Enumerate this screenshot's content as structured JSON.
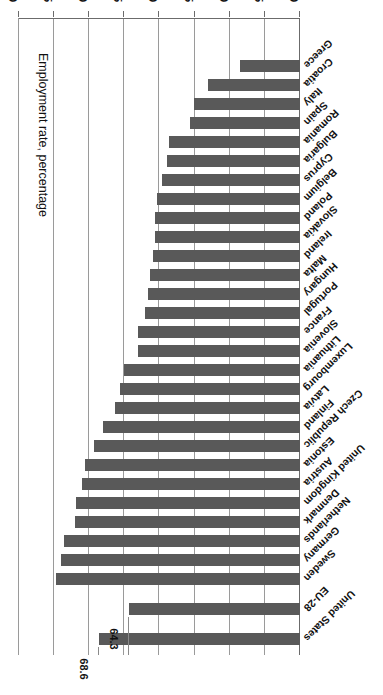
{
  "chart_data": {
    "type": "bar",
    "orientation": "horizontal",
    "title": "",
    "xlabel": "Employment rate, percentage",
    "ylabel": "",
    "xlim": [
      40,
      80
    ],
    "xticks": [
      80,
      75,
      70,
      65,
      60,
      55,
      50,
      45,
      40
    ],
    "grid": true,
    "legend": "none",
    "bar_color": "#595959",
    "categories": [
      "United States",
      "EU-28",
      "Sweden",
      "Germany",
      "Netherlands",
      "Denmark",
      "United Kingdom",
      "Austria",
      "Estonia",
      "Czech Republic",
      "Finland",
      "Latvia",
      "Luxembourg",
      "Lithuania",
      "Slovenia",
      "France",
      "Portugal",
      "Hungary",
      "Malta",
      "Ireland",
      "Slovakia",
      "Poland",
      "Belgium",
      "Cyprus",
      "Bulgaria",
      "Romania",
      "Spain",
      "Italy",
      "Croatia",
      "Greece"
    ],
    "values": [
      68.6,
      64.3,
      74.7,
      74.0,
      73.6,
      72.0,
      71.9,
      71.1,
      70.6,
      69.3,
      68.1,
      66.3,
      65.6,
      65.0,
      63.1,
      63.0,
      62.0,
      61.7,
      61.3,
      60.9,
      60.7,
      60.6,
      60.4,
      59.6,
      58.9,
      58.6,
      55.7,
      55.1,
      53.1,
      48.6
    ],
    "data_labels": {
      "United States": "68.6",
      "EU-28": "64.3"
    },
    "gap_after_index": [
      0,
      1
    ]
  }
}
